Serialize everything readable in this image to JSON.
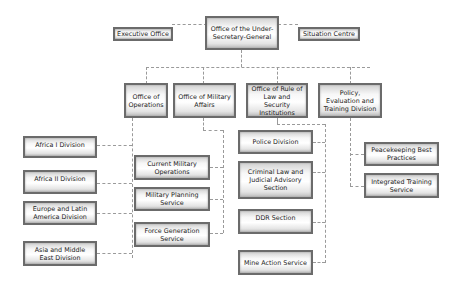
{
  "diagram": {
    "type": "organization-chart",
    "root": "Office of the Under-Secretary-General",
    "staff": [
      "Executive Office",
      "Situation Centre"
    ],
    "offices": [
      {
        "label": "Office of Operations",
        "units": [
          "Africa I Division",
          "Africa II Division",
          "Europe and Latin America Division",
          "Asia and Middle East Division"
        ]
      },
      {
        "label": "Office of Military Affairs",
        "units": [
          "Current Military Operations",
          "Military Planning Service",
          "Force Generation Service"
        ]
      },
      {
        "label": "Office of Rule of Law and Security Institutions",
        "units": [
          "Police Division",
          "Criminal Law and Judicial Advisory Section",
          "DDR Section",
          "Mine Action Service"
        ]
      },
      {
        "label": "Policy, Evaluation and Training Division",
        "units": [
          "Peacekeeping Best Practices",
          "Integrated Training Service"
        ]
      }
    ]
  },
  "colors": {
    "border": "#6b6b6b",
    "connector": "#9a9a9a",
    "text": "#222222"
  }
}
